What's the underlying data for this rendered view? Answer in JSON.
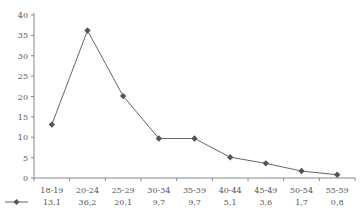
{
  "chart_data": {
    "type": "line",
    "title": "",
    "xlabel": "",
    "ylabel": "",
    "categories": [
      "18-19",
      "20-24",
      "25-29",
      "30-34",
      "35-39",
      "40-44",
      "45-49",
      "50-54",
      "55-59"
    ],
    "series": [
      {
        "name": "",
        "values": [
          13.1,
          36.2,
          20.1,
          9.7,
          9.7,
          5.1,
          3.6,
          1.7,
          0.8
        ],
        "value_labels": [
          "13,1",
          "36,2",
          "20,1",
          "9,7",
          "9,7",
          "5,1",
          "3,6",
          "1,7",
          "0,8"
        ],
        "color": "#555555",
        "marker": "diamond"
      }
    ],
    "ylim": [
      0,
      40
    ],
    "yticks": [
      0,
      5,
      10,
      15,
      20,
      25,
      30,
      35,
      40
    ],
    "ytick_labels": [
      "0",
      "5",
      "10",
      "15",
      "20",
      "25",
      "30",
      "35",
      "40"
    ],
    "grid": false,
    "legend": "data-table-below"
  }
}
